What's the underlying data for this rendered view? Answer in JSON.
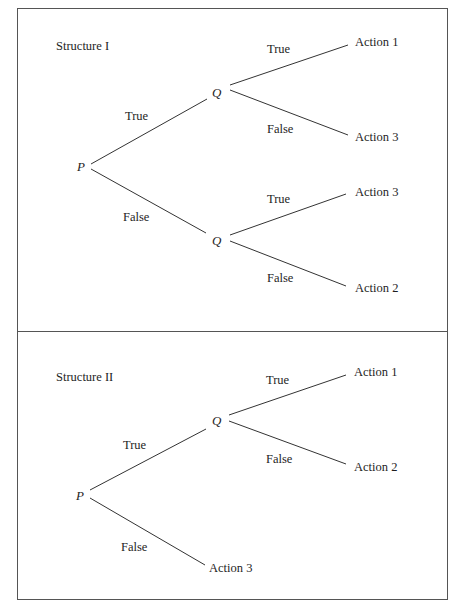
{
  "structure1": {
    "title": "Structure I",
    "root": "P",
    "q_top": "Q",
    "q_bottom": "Q",
    "edge_p_true": "True",
    "edge_p_false": "False",
    "edge_qtop_true": "True",
    "edge_qtop_false": "False",
    "edge_qbot_true": "True",
    "edge_qbot_false": "False",
    "leaf_qtop_true": "Action 1",
    "leaf_qtop_false": "Action 3",
    "leaf_qbot_true": "Action 3",
    "leaf_qbot_false": "Action 2"
  },
  "structure2": {
    "title": "Structure II",
    "root": "P",
    "q": "Q",
    "edge_p_true": "True",
    "edge_p_false": "False",
    "edge_q_true": "True",
    "edge_q_false": "False",
    "leaf_q_true": "Action 1",
    "leaf_q_false": "Action 2",
    "leaf_p_false": "Action 3"
  },
  "colors": {
    "line": "#333333",
    "border": "#555555",
    "background": "#ffffff"
  }
}
